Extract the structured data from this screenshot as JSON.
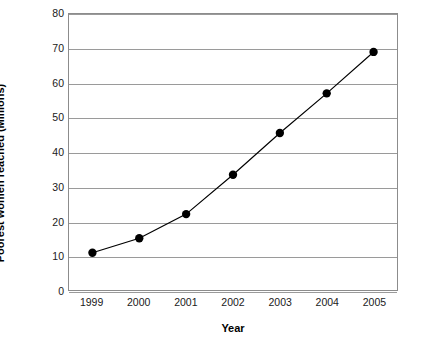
{
  "chart_data": {
    "type": "line",
    "title": "",
    "xlabel": "Year",
    "ylabel": "Poorest women reached (Millions)",
    "categories": [
      "1999",
      "2000",
      "2001",
      "2002",
      "2003",
      "2004",
      "2005"
    ],
    "values": [
      10.8,
      15.0,
      22.0,
      33.4,
      45.5,
      57.0,
      69.0
    ],
    "series": [
      {
        "name": "Poorest women reached",
        "values": [
          10.8,
          15.0,
          22.0,
          33.4,
          45.5,
          57.0,
          69.0
        ]
      }
    ],
    "ylim": [
      0,
      80
    ],
    "yticks": [
      0,
      10,
      20,
      30,
      40,
      50,
      60,
      70,
      80
    ],
    "ytick_labels": [
      "0",
      "10",
      "20",
      "30",
      "40",
      "50",
      "60",
      "70",
      "80"
    ],
    "xtick_labels": [
      "1999",
      "2000",
      "2001",
      "2002",
      "2003",
      "2004",
      "2005"
    ],
    "grid": "horizontal",
    "legend": "none",
    "marker": "filled-circle",
    "line_color": "#000000",
    "marker_color": "#000000",
    "grid_color": "#9a9a9a",
    "frame_color": "#8c8c8c",
    "background_color": "#ffffff"
  }
}
